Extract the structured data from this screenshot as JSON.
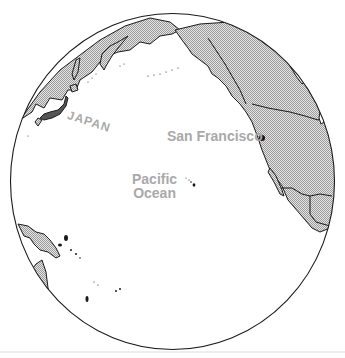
{
  "map": {
    "projection": "orthographic globe centered on North Pacific",
    "labels": {
      "city": "San Francisco",
      "ocean_line1": "Pacific",
      "ocean_line2": "Ocean",
      "country": "JAPAN"
    },
    "markers": [
      {
        "name": "San Francisco",
        "type": "city-dot"
      }
    ],
    "colors": {
      "land_fill": "#d4d4d4",
      "outline": "#1a1a1a",
      "label": "#a9a9a9",
      "water": "#ffffff"
    }
  }
}
